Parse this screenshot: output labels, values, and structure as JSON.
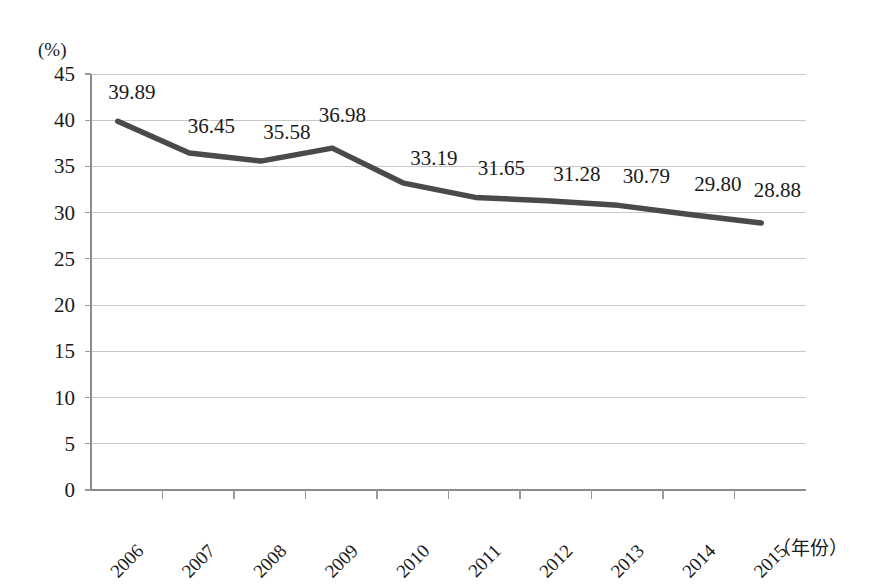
{
  "chart_data": {
    "type": "line",
    "title": "",
    "xlabel": "（年份）",
    "ylabel": "(%)",
    "categories": [
      "2006",
      "2007",
      "2008",
      "2009",
      "2010",
      "2011",
      "2012",
      "2013",
      "2014",
      "2015"
    ],
    "values": [
      39.89,
      36.45,
      35.58,
      36.98,
      33.19,
      31.65,
      31.28,
      30.79,
      29.8,
      28.88
    ],
    "point_labels": [
      "39.89",
      "36.45",
      "35.58",
      "36.98",
      "33.19",
      "31.65",
      "31.28",
      "30.79",
      "29.80",
      "28.88"
    ],
    "ylim": [
      0,
      45
    ],
    "ytick_step": 5,
    "ytick_labels": [
      "45",
      "40",
      "35",
      "30",
      "25",
      "20",
      "15",
      "10",
      "5",
      "0"
    ],
    "ytick_values": [
      45,
      40,
      35,
      30,
      25,
      20,
      15,
      10,
      5,
      0
    ],
    "grid": true,
    "grid_axis": "y",
    "legend": "none",
    "series": [
      {
        "name": "",
        "values": [
          39.89,
          36.45,
          35.58,
          36.98,
          33.19,
          31.65,
          31.28,
          30.79,
          29.8,
          28.88
        ],
        "color": "#4a4a4a"
      }
    ],
    "colors": {
      "line": "#4a4a4a",
      "grid": "#c8c8c8",
      "axis": "#8a8a8a",
      "text": "#1a1a1a",
      "background": "#ffffff"
    },
    "xtick_rotation_deg": -45
  }
}
